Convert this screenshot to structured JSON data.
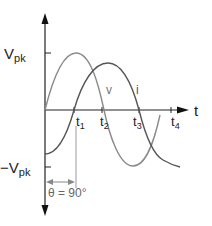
{
  "diagram": {
    "y_axis": {
      "top_label": "V",
      "top_label_sub": "pk",
      "bottom_label": "−V",
      "bottom_label_sub": "pk"
    },
    "x_axis": {
      "label": "t",
      "ticks": [
        {
          "name": "t",
          "sub": "1"
        },
        {
          "name": "t",
          "sub": "2"
        },
        {
          "name": "t",
          "sub": "3"
        },
        {
          "name": "t",
          "sub": "4"
        }
      ]
    },
    "curves": [
      {
        "name": "v",
        "label": "v",
        "color": "#8a8a8a"
      },
      {
        "name": "i",
        "label": "i",
        "color": "#555555"
      }
    ],
    "phase_annotation": "θ = 90°",
    "colors": {
      "axis": "#222222",
      "v_curve": "#8a8a8a",
      "i_curve": "#555555",
      "marker_line": "#999999"
    }
  }
}
